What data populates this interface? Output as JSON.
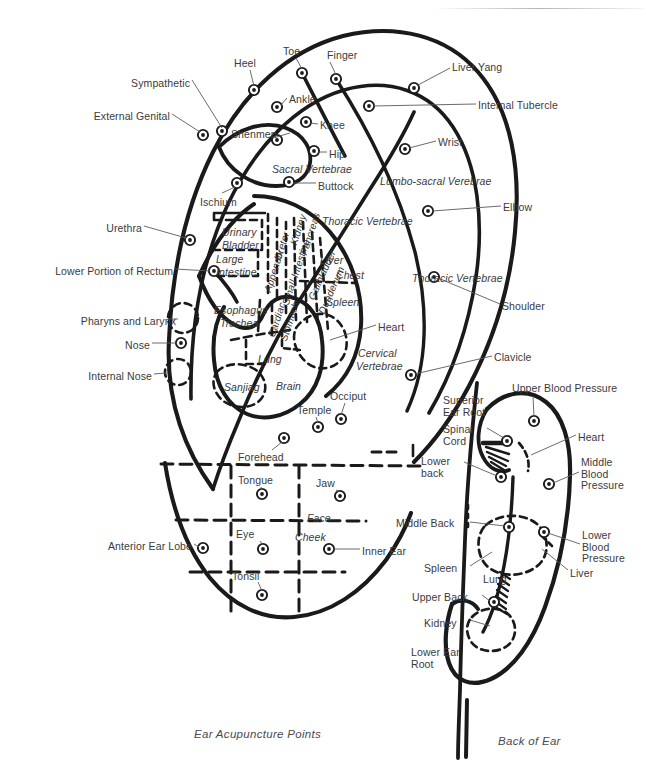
{
  "figure": {
    "caption_left": "Ear Acupuncture Points",
    "caption_right": "Back of Ear",
    "ink": "#1a1a1a",
    "label_color": "#3a3a3c"
  },
  "front": {
    "title": "Ear Acupuncture Points",
    "leader_labels": [
      {
        "name": "sympathetic",
        "text": "Sympathetic",
        "x": 104,
        "y": 78,
        "w": 86,
        "align": "right",
        "style": "plain"
      },
      {
        "name": "external-genital",
        "text": "External Genital",
        "x": 62,
        "y": 111,
        "w": 108,
        "align": "right",
        "style": "plain"
      },
      {
        "name": "heel",
        "text": "Heel",
        "x": 234,
        "y": 58,
        "w": 32,
        "align": "left",
        "style": "plain"
      },
      {
        "name": "toe",
        "text": "Toe",
        "x": 283,
        "y": 46,
        "w": 26,
        "align": "left",
        "style": "plain"
      },
      {
        "name": "finger",
        "text": "Finger",
        "x": 327,
        "y": 50,
        "w": 44,
        "align": "left",
        "style": "plain"
      },
      {
        "name": "liver-yang",
        "text": "Liver Yang",
        "x": 452,
        "y": 62,
        "w": 68,
        "align": "left",
        "style": "plain"
      },
      {
        "name": "internal-tubercle",
        "text": "Internal Tubercle",
        "x": 478,
        "y": 100,
        "w": 110,
        "align": "left",
        "style": "plain"
      },
      {
        "name": "ankle",
        "text": "Ankle",
        "x": 289,
        "y": 94,
        "w": 38,
        "align": "left",
        "style": "plain"
      },
      {
        "name": "shenmen",
        "text": "Shenmen",
        "x": 231,
        "y": 129,
        "w": 58,
        "align": "left",
        "style": "plain"
      },
      {
        "name": "knee",
        "text": "Knee",
        "x": 320,
        "y": 120,
        "w": 36,
        "align": "left",
        "style": "plain"
      },
      {
        "name": "hip",
        "text": "Hip",
        "x": 329,
        "y": 149,
        "w": 24,
        "align": "left",
        "style": "plain"
      },
      {
        "name": "wrist",
        "text": "Wrist",
        "x": 438,
        "y": 137,
        "w": 36,
        "align": "left",
        "style": "plain"
      },
      {
        "name": "buttock",
        "text": "Buttock",
        "x": 318,
        "y": 181,
        "w": 50,
        "align": "left",
        "style": "plain"
      },
      {
        "name": "ischium",
        "text": "Ischium",
        "x": 200,
        "y": 197,
        "w": 50,
        "align": "left",
        "style": "plain"
      },
      {
        "name": "elbow",
        "text": "Elbow",
        "x": 503,
        "y": 202,
        "w": 40,
        "align": "left",
        "style": "plain"
      },
      {
        "name": "urethra",
        "text": "Urethra",
        "x": 90,
        "y": 223,
        "w": 52,
        "align": "right",
        "style": "plain"
      },
      {
        "name": "lower-portion-of-rectum",
        "text": "Lower Portion of Rectum",
        "x": 33,
        "y": 266,
        "w": 140,
        "align": "right",
        "style": "plain"
      },
      {
        "name": "shoulder",
        "text": "Shoulder",
        "x": 502,
        "y": 301,
        "w": 58,
        "align": "left",
        "style": "plain"
      },
      {
        "name": "pharyns-and-larynx",
        "text": "Pharyns and Larynx",
        "x": 58,
        "y": 316,
        "w": 118,
        "align": "right",
        "style": "plain"
      },
      {
        "name": "nose",
        "text": "Nose",
        "x": 116,
        "y": 340,
        "w": 34,
        "align": "right",
        "style": "plain"
      },
      {
        "name": "heart-front",
        "text": "Heart",
        "x": 378,
        "y": 322,
        "w": 38,
        "align": "left",
        "style": "plain"
      },
      {
        "name": "clavicle",
        "text": "Clavicle",
        "x": 494,
        "y": 352,
        "w": 50,
        "align": "left",
        "style": "plain"
      },
      {
        "name": "internal-nose",
        "text": "Internal Nose",
        "x": 66,
        "y": 371,
        "w": 86,
        "align": "right",
        "style": "plain"
      },
      {
        "name": "occiput",
        "text": "Occiput",
        "x": 330,
        "y": 391,
        "w": 50,
        "align": "left",
        "style": "plain"
      },
      {
        "name": "temple",
        "text": "Temple",
        "x": 297,
        "y": 405,
        "w": 46,
        "align": "left",
        "style": "plain"
      },
      {
        "name": "forehead",
        "text": "Forehead",
        "x": 238,
        "y": 452,
        "w": 58,
        "align": "left",
        "style": "plain"
      },
      {
        "name": "tongue",
        "text": "Tongue",
        "x": 238,
        "y": 475,
        "w": 48,
        "align": "left",
        "style": "plain"
      },
      {
        "name": "jaw",
        "text": "Jaw",
        "x": 316,
        "y": 478,
        "w": 28,
        "align": "left",
        "style": "plain"
      },
      {
        "name": "eye",
        "text": "Eye",
        "x": 236,
        "y": 529,
        "w": 26,
        "align": "left",
        "style": "plain"
      },
      {
        "name": "anterior-ear-lobe",
        "text": "Anterior Ear Lobe",
        "x": 84,
        "y": 541,
        "w": 108,
        "align": "right",
        "style": "plain"
      },
      {
        "name": "inner-ear",
        "text": "Inner Ear",
        "x": 362,
        "y": 546,
        "w": 58,
        "align": "left",
        "style": "plain"
      },
      {
        "name": "tonsil",
        "text": "Tonsil",
        "x": 232,
        "y": 571,
        "w": 40,
        "align": "left",
        "style": "plain"
      }
    ],
    "zone_labels": [
      {
        "name": "sacral-vertebrae",
        "text": "Sacral Vertebrae",
        "x": 272,
        "y": 164,
        "style": "italic"
      },
      {
        "name": "lumbo-sacral-verebrae",
        "text": "Lumbo-sacral Verebrae",
        "x": 380,
        "y": 176,
        "style": "italic"
      },
      {
        "name": "thoracic-vertebrae-in",
        "text": "Thoracic Vertebrae",
        "x": 322,
        "y": 216,
        "style": "italic"
      },
      {
        "name": "thoracic-vertebrae-out",
        "text": "Thoracic Vertebrae",
        "x": 412,
        "y": 273,
        "style": "italic"
      },
      {
        "name": "urinary",
        "text": "Urinary",
        "x": 222,
        "y": 227,
        "style": "italic"
      },
      {
        "name": "bladder",
        "text": "Bladder",
        "x": 222,
        "y": 240,
        "style": "italic"
      },
      {
        "name": "large",
        "text": "Large",
        "x": 216,
        "y": 254,
        "style": "italic"
      },
      {
        "name": "intestine",
        "text": "Intestine",
        "x": 216,
        "y": 267,
        "style": "italic"
      },
      {
        "name": "esophagus",
        "text": "Esophagus",
        "x": 214,
        "y": 305,
        "style": "italic"
      },
      {
        "name": "trachea",
        "text": "Trachea",
        "x": 220,
        "y": 318,
        "style": "italic"
      },
      {
        "name": "liver-zone",
        "text": "Liver",
        "x": 320,
        "y": 255,
        "style": "italic"
      },
      {
        "name": "chest",
        "text": "Chest",
        "x": 336,
        "y": 270,
        "style": "italic"
      },
      {
        "name": "spleen-front",
        "text": "Spleen",
        "x": 326,
        "y": 297,
        "style": "italic"
      },
      {
        "name": "cervical",
        "text": "Cervical",
        "x": 358,
        "y": 348,
        "style": "italic"
      },
      {
        "name": "vertebrae",
        "text": "Vertebrae",
        "x": 356,
        "y": 361,
        "style": "italic"
      },
      {
        "name": "lung-front",
        "text": "Lung",
        "x": 258,
        "y": 354,
        "style": "italic"
      },
      {
        "name": "brain",
        "text": "Brain",
        "x": 276,
        "y": 381,
        "style": "italic"
      },
      {
        "name": "sanjiag",
        "text": "Sanjiag",
        "x": 224,
        "y": 382,
        "style": "italic"
      },
      {
        "name": "face",
        "text": "Face",
        "x": 307,
        "y": 513,
        "style": "italic"
      },
      {
        "name": "cheek",
        "text": "Cheek",
        "x": 295,
        "y": 532,
        "style": "italic"
      }
    ],
    "vertical_labels": [
      {
        "name": "appendix",
        "text": "Appendix",
        "x": 262,
        "y": 290,
        "angle": -72
      },
      {
        "name": "ureter",
        "text": "Ureter",
        "x": 272,
        "y": 258,
        "angle": -72
      },
      {
        "name": "small-intestine",
        "text": "Small Intestine",
        "x": 280,
        "y": 303,
        "angle": -72
      },
      {
        "name": "kidney",
        "text": "Kidney",
        "x": 288,
        "y": 243,
        "angle": -72
      },
      {
        "name": "pancreas",
        "text": "Pancreas",
        "x": 298,
        "y": 253,
        "angle": -72
      },
      {
        "name": "gallbladder",
        "text": "Gallbladder",
        "x": 306,
        "y": 297,
        "angle": -66
      },
      {
        "name": "duodenum",
        "text": "Duodenum",
        "x": 316,
        "y": 311,
        "angle": -66
      },
      {
        "name": "cardiac",
        "text": "Cardiac",
        "x": 266,
        "y": 335,
        "angle": -72
      },
      {
        "name": "stomach",
        "text": "Stomach",
        "x": 278,
        "y": 339,
        "angle": -72
      }
    ]
  },
  "back": {
    "title": "Back of Ear",
    "leader_labels": [
      {
        "name": "upper-blood-pressure",
        "text": "Upper Blood Pressure",
        "x": 512,
        "y": 383,
        "w": 130,
        "align": "left",
        "style": "plain"
      },
      {
        "name": "superior-ear-root",
        "text": "Superior\nEar Root",
        "x": 443,
        "y": 395,
        "w": 58,
        "align": "left",
        "style": "plain"
      },
      {
        "name": "spinal-cord",
        "text": "Spinal\nCord",
        "x": 443,
        "y": 424,
        "w": 42,
        "align": "left",
        "style": "plain"
      },
      {
        "name": "heart-back",
        "text": "Heart",
        "x": 578,
        "y": 432,
        "w": 40,
        "align": "left",
        "style": "plain"
      },
      {
        "name": "middle-blood-pressure",
        "text": "Middle\nBlood\nPressure",
        "x": 581,
        "y": 457,
        "w": 60,
        "align": "left",
        "style": "plain"
      },
      {
        "name": "lower-back",
        "text": "Lower\nback",
        "x": 421,
        "y": 456,
        "w": 42,
        "align": "left",
        "style": "plain"
      },
      {
        "name": "middle-back",
        "text": "Middle Back",
        "x": 396,
        "y": 518,
        "w": 72,
        "align": "left",
        "style": "plain"
      },
      {
        "name": "lower-blood-pressure",
        "text": "Lower\nBlood\nPressure",
        "x": 582,
        "y": 530,
        "w": 60,
        "align": "left",
        "style": "plain"
      },
      {
        "name": "spleen-back",
        "text": "Spleen",
        "x": 424,
        "y": 563,
        "w": 44,
        "align": "left",
        "style": "plain"
      },
      {
        "name": "liver-back",
        "text": "Liver",
        "x": 570,
        "y": 568,
        "w": 36,
        "align": "left",
        "style": "plain"
      },
      {
        "name": "lung-back",
        "text": "Lung",
        "x": 483,
        "y": 574,
        "w": 34,
        "align": "left",
        "style": "plain"
      },
      {
        "name": "upper-back",
        "text": "Upper Back",
        "x": 412,
        "y": 592,
        "w": 68,
        "align": "left",
        "style": "plain"
      },
      {
        "name": "kidney-back",
        "text": "Kidney",
        "x": 424,
        "y": 618,
        "w": 44,
        "align": "left",
        "style": "plain"
      },
      {
        "name": "lower-ear-root",
        "text": "Lower Ear\nRoot",
        "x": 411,
        "y": 647,
        "w": 58,
        "align": "left",
        "style": "plain"
      }
    ]
  },
  "points": {
    "front": [
      {
        "name": "point-external-genital",
        "cx": 203,
        "cy": 135
      },
      {
        "name": "point-sympathetic",
        "cx": 222,
        "cy": 131
      },
      {
        "name": "point-heel",
        "cx": 254,
        "cy": 90
      },
      {
        "name": "point-toe",
        "cx": 302,
        "cy": 73
      },
      {
        "name": "point-finger",
        "cx": 336,
        "cy": 79
      },
      {
        "name": "point-liver-yang",
        "cx": 414,
        "cy": 88
      },
      {
        "name": "point-ankle",
        "cx": 277,
        "cy": 107
      },
      {
        "name": "point-shenmen",
        "cx": 277,
        "cy": 140
      },
      {
        "name": "point-knee",
        "cx": 306,
        "cy": 122
      },
      {
        "name": "point-internal-tubercle",
        "cx": 369,
        "cy": 106
      },
      {
        "name": "point-hip",
        "cx": 314,
        "cy": 151
      },
      {
        "name": "point-wrist",
        "cx": 405,
        "cy": 149
      },
      {
        "name": "point-buttock",
        "cx": 289,
        "cy": 182
      },
      {
        "name": "point-ischium",
        "cx": 237,
        "cy": 183
      },
      {
        "name": "point-elbow",
        "cx": 428,
        "cy": 211
      },
      {
        "name": "point-urethra",
        "cx": 190,
        "cy": 240
      },
      {
        "name": "point-rectum",
        "cx": 214,
        "cy": 271
      },
      {
        "name": "point-shoulder",
        "cx": 434,
        "cy": 277
      },
      {
        "name": "point-nose",
        "cx": 181,
        "cy": 343
      },
      {
        "name": "point-clavicle",
        "cx": 411,
        "cy": 375
      },
      {
        "name": "point-occiput",
        "cx": 341,
        "cy": 419
      },
      {
        "name": "point-temple",
        "cx": 318,
        "cy": 427
      },
      {
        "name": "point-forehead",
        "cx": 284,
        "cy": 438
      },
      {
        "name": "point-tongue",
        "cx": 262,
        "cy": 494
      },
      {
        "name": "point-jaw",
        "cx": 340,
        "cy": 496
      },
      {
        "name": "point-anterior-ear-lobe",
        "cx": 203,
        "cy": 548
      },
      {
        "name": "point-eye",
        "cx": 263,
        "cy": 549
      },
      {
        "name": "point-inner-ear",
        "cx": 329,
        "cy": 549
      },
      {
        "name": "point-tonsil",
        "cx": 262,
        "cy": 595
      }
    ],
    "back": [
      {
        "name": "point-upper-blood-pressure",
        "cx": 534,
        "cy": 421
      },
      {
        "name": "point-spinal-cord",
        "cx": 507,
        "cy": 441
      },
      {
        "name": "point-lower-back",
        "cx": 501,
        "cy": 477
      },
      {
        "name": "point-middle-blood-pressure",
        "cx": 549,
        "cy": 484
      },
      {
        "name": "point-middle-back",
        "cx": 509,
        "cy": 527
      },
      {
        "name": "point-lower-blood-pressure",
        "cx": 544,
        "cy": 532
      },
      {
        "name": "point-upper-back",
        "cx": 494,
        "cy": 602
      }
    ]
  }
}
